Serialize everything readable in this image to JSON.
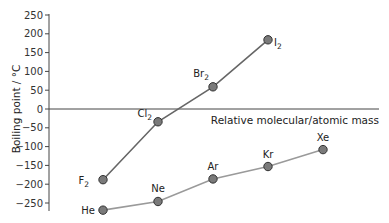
{
  "chart_data": {
    "type": "line",
    "title": "",
    "xlabel": "Relative molecular/atomic mass",
    "ylabel": "Boiling point / °C",
    "ylim": [
      -250,
      250
    ],
    "yticks": [
      250,
      200,
      150,
      100,
      50,
      0,
      -50,
      -100,
      -150,
      -200,
      -250
    ],
    "grid": false,
    "legend": "none",
    "series": [
      {
        "name": "Halogens",
        "color": "#666666",
        "points": [
          {
            "label": "F",
            "sub": "2",
            "value": -188
          },
          {
            "label": "Cl",
            "sub": "2",
            "value": -34
          },
          {
            "label": "Br",
            "sub": "2",
            "value": 59
          },
          {
            "label": "I",
            "sub": "2",
            "value": 184
          }
        ]
      },
      {
        "name": "Noble gases",
        "color": "#9a9a9a",
        "points": [
          {
            "label": "He",
            "sub": "",
            "value": -269
          },
          {
            "label": "Ne",
            "sub": "",
            "value": -246
          },
          {
            "label": "Ar",
            "sub": "",
            "value": -186
          },
          {
            "label": "Kr",
            "sub": "",
            "value": -153
          },
          {
            "label": "Xe",
            "sub": "",
            "value": -108
          }
        ]
      }
    ]
  }
}
